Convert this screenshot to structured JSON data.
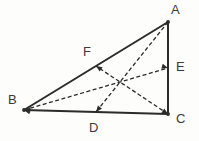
{
  "figure": {
    "canvas": {
      "width": 199,
      "height": 141
    },
    "background_color": "#fdfdfb",
    "stroke_color": "#2b2b2b",
    "dashed_color": "#2b2b2b",
    "label_color": "#3a3a3a",
    "solid_stroke_width": 2.0,
    "dashed_stroke_width": 1.3,
    "dash_pattern": "4,2.5"
  },
  "points": [
    {
      "id": "A",
      "label": "A",
      "x": 168,
      "y": 22,
      "label_x": 171,
      "label_y": 3,
      "kind": "vertex"
    },
    {
      "id": "B",
      "label": "B",
      "x": 24,
      "y": 110,
      "label_x": 8,
      "label_y": 93,
      "kind": "vertex"
    },
    {
      "id": "C",
      "label": "C",
      "x": 168,
      "y": 114,
      "label_x": 176,
      "label_y": 112,
      "kind": "vertex"
    },
    {
      "id": "D",
      "label": "D",
      "x": 96,
      "y": 112,
      "label_x": 89,
      "label_y": 121,
      "kind": "midpoint-of-BC"
    },
    {
      "id": "E",
      "label": "E",
      "x": 168,
      "y": 68,
      "label_x": 176,
      "label_y": 60,
      "kind": "midpoint-of-AC"
    },
    {
      "id": "F",
      "label": "F",
      "x": 96,
      "y": 66,
      "label_x": 83,
      "label_y": 45,
      "kind": "midpoint-of-AB"
    }
  ],
  "centroid": {
    "id": "G",
    "x": 120,
    "y": 82,
    "labeled": false
  },
  "solid_segments": [
    {
      "name": "side-AB",
      "from": "A",
      "to": "B",
      "x1": 168,
      "y1": 22,
      "x2": 24,
      "y2": 110
    },
    {
      "name": "side-BC",
      "from": "B",
      "to": "C",
      "x1": 24,
      "y1": 110,
      "x2": 168,
      "y2": 114
    },
    {
      "name": "side-CA",
      "from": "C",
      "to": "A",
      "x1": 168,
      "y1": 114,
      "x2": 168,
      "y2": 22
    }
  ],
  "dashed_segments": [
    {
      "name": "median-AD",
      "from": "A",
      "to": "D",
      "x1": 168,
      "y1": 22,
      "x2": 96,
      "y2": 112
    },
    {
      "name": "median-BE",
      "from": "B",
      "to": "E",
      "x1": 24,
      "y1": 110,
      "x2": 168,
      "y2": 68
    },
    {
      "name": "median-CF",
      "from": "C",
      "to": "F",
      "x1": 168,
      "y1": 114,
      "x2": 96,
      "y2": 66
    }
  ],
  "arrowheads": [
    {
      "name": "arrow-at-B-on-BE",
      "at": "B",
      "x": 24,
      "y": 110,
      "angle": 196
    },
    {
      "name": "arrow-at-E-on-BE",
      "at": "E",
      "x": 168,
      "y": 68,
      "angle": 16
    },
    {
      "name": "arrow-at-D-on-AD",
      "at": "D",
      "x": 96,
      "y": 112,
      "angle": 129
    },
    {
      "name": "arrow-at-F-on-CF",
      "at": "F",
      "x": 96,
      "y": 66,
      "angle": 214
    },
    {
      "name": "arrow-at-C-on-CF",
      "at": "C",
      "x": 168,
      "y": 114,
      "angle": 34
    },
    {
      "name": "arrow-at-B-on-BC",
      "at": "B",
      "x": 24,
      "y": 110,
      "angle": 182
    }
  ]
}
